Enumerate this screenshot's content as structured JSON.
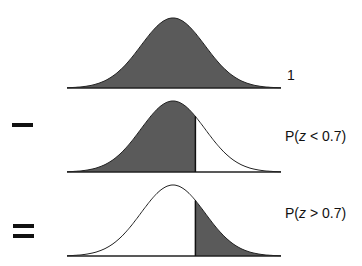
{
  "rows": [
    {
      "operator": "",
      "label": "1",
      "shade": "all"
    },
    {
      "operator": "minus",
      "label_prefix": "P(",
      "label_var": "z",
      "label_suffix": " < 0.7)",
      "shade": "left"
    },
    {
      "operator": "equals",
      "label_prefix": "P(",
      "label_var": "z",
      "label_suffix": " > 0.7)",
      "shade": "right"
    }
  ],
  "colors": {
    "fill": "#5a5a5a",
    "stroke": "#222222",
    "background": "#ffffff"
  },
  "cut_z": 0.7
}
